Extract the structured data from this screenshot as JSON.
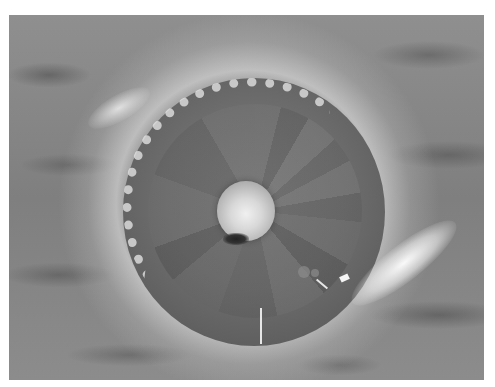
{
  "image": {
    "description": "Grayscale photograph of a circular structure with a bright central sphere, radial wedge segments, and a ring of crystalline granules around the upper-left rim, surrounded by a bright halo on a mottled gray background",
    "palette": {
      "background": "#8a8a8a",
      "disc": "#6e6e6e",
      "sphere_highlight": "#f0f0f0",
      "halo": "#ebebeb",
      "border": "#ffffff"
    }
  }
}
